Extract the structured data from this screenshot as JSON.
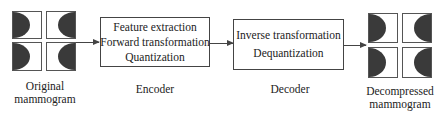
{
  "input": {
    "label_line1": "Original",
    "label_line2": "mammogram"
  },
  "encoder": {
    "steps": [
      "Feature extraction",
      "Forward transformation",
      "Quantization"
    ],
    "label": "Encoder"
  },
  "decoder": {
    "steps": [
      "Inverse transformation",
      "Dequantization"
    ],
    "label": "Decoder"
  },
  "output": {
    "label_line1": "Decompressed",
    "label_line2": "mammogram"
  },
  "colors": {
    "line": "#444444",
    "fill_dark": "#3a3a3a",
    "background": "#ffffff"
  }
}
